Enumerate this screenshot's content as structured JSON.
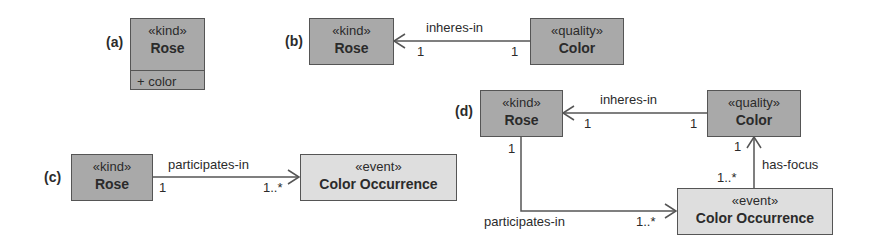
{
  "panels": {
    "a": {
      "label": "(a)",
      "class_box": {
        "stereotype": "«kind»",
        "name": "Rose",
        "attribute": "+ color"
      }
    },
    "b": {
      "label": "(b)",
      "source": {
        "stereotype": "«kind»",
        "name": "Rose"
      },
      "target": {
        "stereotype": "«quality»",
        "name": "Color"
      },
      "relation": {
        "name": "inheres-in",
        "mult_rose": "1",
        "mult_color": "1"
      }
    },
    "c": {
      "label": "(c)",
      "source": {
        "stereotype": "«kind»",
        "name": "Rose"
      },
      "target": {
        "stereotype": "«event»",
        "name": "Color Occurrence"
      },
      "relation": {
        "name": "participates-in",
        "mult_rose": "1",
        "mult_event": "1..*"
      }
    },
    "d": {
      "label": "(d)",
      "rose": {
        "stereotype": "«kind»",
        "name": "Rose"
      },
      "color": {
        "stereotype": "«quality»",
        "name": "Color"
      },
      "event": {
        "stereotype": "«event»",
        "name": "Color Occurrence"
      },
      "inheres": {
        "name": "inheres-in",
        "mult_rose": "1",
        "mult_color": "1"
      },
      "participates": {
        "name": "participates-in",
        "mult_rose": "1",
        "mult_event": "1..*"
      },
      "focus": {
        "name": "has-focus",
        "mult_color": "1",
        "mult_event": "1..*"
      }
    }
  },
  "colors": {
    "kind_fill": "#a9a9a9",
    "event_fill": "#dedede",
    "stroke": "#555555"
  }
}
